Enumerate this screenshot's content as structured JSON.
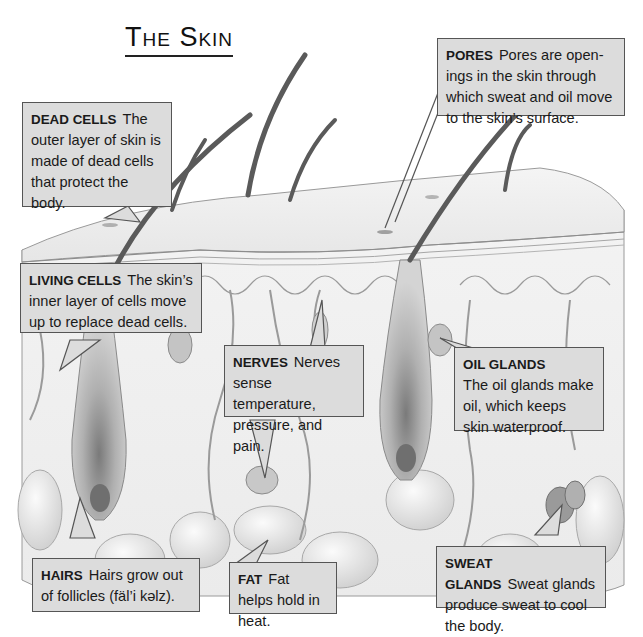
{
  "title": {
    "prefix": "T",
    "rest": "HE ",
    "word_initial": "S",
    "word_rest": "KIN",
    "full": "The Skin"
  },
  "callouts": {
    "dead_cells": {
      "heading": "DEAD CELLS",
      "text": "The outer layer of skin is made of dead cells that protect the body."
    },
    "pores": {
      "heading": "PORES",
      "text": "Pores are open-ings in the skin through which sweat and oil move to the skin’s surface."
    },
    "living_cells": {
      "heading": "LIVING CELLS",
      "text": "The skin’s inner layer of cells move up to replace dead cells."
    },
    "nerves": {
      "heading": "NERVES",
      "text": "Nerves sense temperature, pressure, and pain."
    },
    "oil_glands": {
      "heading": "OIL GLANDS",
      "text": "The oil glands make oil, which keeps skin waterproof."
    },
    "hairs": {
      "heading": "HAIRS",
      "text": "Hairs grow out of follicles (fäl’i kəlz)."
    },
    "fat": {
      "heading": "FAT",
      "text": "Fat helps hold in heat."
    },
    "sweat_glands": {
      "heading": "SWEAT GLANDS",
      "text": "Sweat glands produce sweat to cool the body."
    }
  },
  "colors": {
    "callout_fill": "#dcdcdc",
    "callout_border": "#555555",
    "skin_surface": "#eeeeee",
    "dermis": "#f2f2f2",
    "follicle": "#a8a8a8",
    "hair": "#555555",
    "fat": "#e2e2e2"
  }
}
